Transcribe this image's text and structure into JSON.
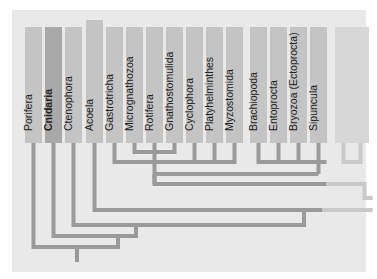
{
  "diagram": {
    "type": "phylogenetic-tree",
    "taxa": [
      {
        "name": "Porifera",
        "style": "normal"
      },
      {
        "name": "Cnidaria",
        "style": "bold"
      },
      {
        "name": "Ctenophora",
        "style": "normal"
      },
      {
        "name": "Acoela",
        "style": "normal"
      },
      {
        "name": "Gastrotricha",
        "style": "normal"
      },
      {
        "name": "Micrognathozoa",
        "style": "normal"
      },
      {
        "name": "Rotifera",
        "style": "normal"
      },
      {
        "name": "Gnathostomulida",
        "style": "normal"
      },
      {
        "name": "Cyclophora",
        "style": "normal"
      },
      {
        "name": "Platyhelminthes",
        "style": "normal"
      },
      {
        "name": "Myzostomida",
        "style": "normal"
      },
      {
        "name": "Brachiopoda",
        "style": "normal"
      },
      {
        "name": "Entoprocta",
        "style": "normal"
      },
      {
        "name": "Bryozoa (Ectoprocta)",
        "style": "normal"
      },
      {
        "name": "Sipuncula",
        "style": "normal"
      },
      {
        "name": "",
        "style": "faint"
      },
      {
        "name": "",
        "style": "faint"
      }
    ],
    "colors": {
      "panel": "#e9e9e9",
      "column": "#c4c4c4",
      "column_highlight": "#a9a9a9",
      "column_faint": "#d7d7d7",
      "branch": "#9a9a9a",
      "branch_faint": "#c9c9c9"
    }
  }
}
